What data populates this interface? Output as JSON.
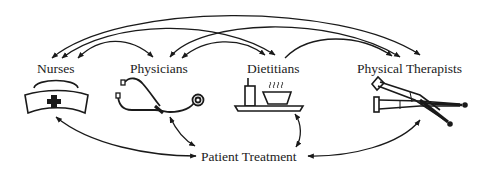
{
  "nodes": {
    "nurses": {
      "label": "Nurses",
      "icon": "nurse-cap-icon"
    },
    "physicians": {
      "label": "Physicians",
      "icon": "stethoscope-icon"
    },
    "dietitians": {
      "label": "Dietitians",
      "icon": "food-tray-icon"
    },
    "physical_therapists": {
      "label": "Physical Therapists",
      "icon": "crutches-icon"
    },
    "patient_treatment": {
      "label": "Patient Treatment"
    }
  },
  "edges": [
    {
      "from": "Nurses",
      "to": "Physical Therapists",
      "type": "bidirectional"
    },
    {
      "from": "Nurses",
      "to": "Dietitians",
      "type": "bidirectional"
    },
    {
      "from": "Nurses",
      "to": "Physicians",
      "type": "bidirectional"
    },
    {
      "from": "Physicians",
      "to": "Dietitians",
      "type": "bidirectional"
    },
    {
      "from": "Physicians",
      "to": "Physical Therapists",
      "type": "bidirectional"
    },
    {
      "from": "Dietitians",
      "to": "Physical Therapists",
      "type": "bidirectional"
    },
    {
      "from": "Nurses",
      "to": "Patient Treatment",
      "type": "bidirectional"
    },
    {
      "from": "Physicians",
      "to": "Patient Treatment",
      "type": "bidirectional"
    },
    {
      "from": "Dietitians",
      "to": "Patient Treatment",
      "type": "bidirectional"
    },
    {
      "from": "Physical Therapists",
      "to": "Patient Treatment",
      "type": "bidirectional"
    }
  ],
  "colors": {
    "stroke": "#1a1a1a",
    "background": "#ffffff"
  }
}
